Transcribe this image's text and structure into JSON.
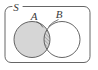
{
  "figure": {
    "type": "venn-diagram",
    "background_color": "#ffffff",
    "stroke_color": "#555555",
    "fill_color": "#d6d6d6",
    "hatch_color": "#6e6e6e"
  },
  "universal_set": {
    "label": "S",
    "label_x": 16,
    "label_y": 11,
    "rect": {
      "x": 5,
      "y": 6.5,
      "width": 85,
      "height": 56,
      "radius": 6
    },
    "gap_start_x": 12,
    "gap_end_x": 23
  },
  "sets": [
    {
      "name": "set-a",
      "label": "A",
      "label_x": 34,
      "label_y": 20,
      "cx": 32,
      "cy": 39.5,
      "r": 18,
      "filled": true,
      "leader": {
        "x1": 36.5,
        "y1": 21.5,
        "x2": 43.0,
        "y2": 27.5
      }
    },
    {
      "name": "set-b",
      "label": "B",
      "label_x": 59,
      "label_y": 18,
      "cx": 62,
      "cy": 39.5,
      "r": 18,
      "filled": false,
      "leader": {
        "x1": 58.5,
        "y1": 19.5,
        "x2": 48.5,
        "y2": 26.5
      }
    }
  ],
  "intersection": {
    "name": "a-intersect-b",
    "shading": "diagonal-hatch",
    "direction": "lower-left-to-upper-right",
    "spacing": 2.6
  }
}
